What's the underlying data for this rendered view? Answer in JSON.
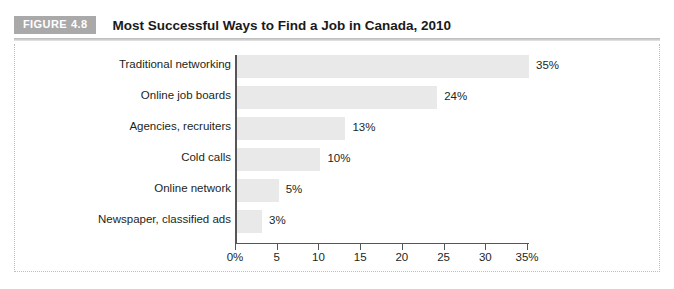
{
  "figure": {
    "badge_label": "FIGURE",
    "badge_number": "4.8",
    "title": "Most Successful Ways to Find a Job in Canada, 2010"
  },
  "colors": {
    "badge_background": "#a9a9a9",
    "badge_text": "#ffffff",
    "bar_fill": "#e9e9e9",
    "axis_line": "#565656",
    "rule": "#bfbfbf",
    "text": "#231f20",
    "frame_dotted": "#bdbdbd"
  },
  "chart_data": {
    "type": "bar",
    "orientation": "horizontal",
    "title": "Most Successful Ways to Find a Job in Canada, 2010",
    "xlabel": "",
    "ylabel": "",
    "categories": [
      "Traditional networking",
      "Online job boards",
      "Agencies, recruiters",
      "Cold calls",
      "Online network",
      "Newspaper, classified ads"
    ],
    "values": [
      35,
      24,
      13,
      10,
      5,
      3
    ],
    "value_labels": [
      "35%",
      "24%",
      "13%",
      "10%",
      "5%",
      "3%"
    ],
    "xlim": [
      0,
      35
    ],
    "xticks": [
      0,
      5,
      10,
      15,
      20,
      25,
      30,
      35
    ],
    "xtick_labels": [
      "0%",
      "5",
      "10",
      "15",
      "20",
      "25",
      "30",
      "35%"
    ],
    "grid": false,
    "legend": null,
    "bar_color": "#e9e9e9"
  }
}
